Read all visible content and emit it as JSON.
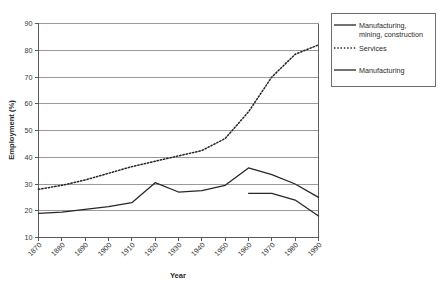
{
  "chart_data": {
    "type": "line",
    "title": "",
    "xlabel": "Year",
    "ylabel": "Employment (%)",
    "xlim": [
      1870,
      1990
    ],
    "ylim": [
      10,
      90
    ],
    "ytick_step": 10,
    "xtick_step": 10,
    "grid": true,
    "legend_position": "top-right",
    "categories": [
      1870,
      1880,
      1890,
      1900,
      1910,
      1920,
      1930,
      1940,
      1950,
      1960,
      1970,
      1980,
      1990
    ],
    "yticks": [
      10,
      20,
      30,
      40,
      50,
      60,
      70,
      80,
      90
    ],
    "xticks": [
      "1870",
      "1880",
      "1890",
      "1900",
      "1910",
      "1920",
      "1930",
      "1940",
      "1950",
      "1960",
      "1970",
      "1980",
      "1990"
    ],
    "series": [
      {
        "name": "Manufacturing, mining, construction",
        "style": "solid",
        "color": "#262626",
        "x": [
          1870,
          1880,
          1890,
          1900,
          1910,
          1920,
          1930,
          1940,
          1950,
          1960,
          1970,
          1980,
          1990
        ],
        "values": [
          19,
          19.5,
          20.5,
          21.5,
          23,
          30.5,
          27,
          27.5,
          29.5,
          36,
          33.5,
          30,
          25
        ]
      },
      {
        "name": "Services",
        "style": "dotted",
        "color": "#262626",
        "x": [
          1870,
          1880,
          1890,
          1900,
          1910,
          1920,
          1930,
          1940,
          1950,
          1960,
          1970,
          1980,
          1990
        ],
        "values": [
          28,
          29.5,
          31.5,
          34,
          36.5,
          38.5,
          40.5,
          42.5,
          47,
          57,
          70,
          78.5,
          82
        ]
      },
      {
        "name": "Manufacturing",
        "style": "solid",
        "color": "#262626",
        "x": [
          1960,
          1970,
          1980,
          1990
        ],
        "values": [
          26.5,
          26.5,
          24,
          18
        ]
      }
    ]
  },
  "legend": {
    "entries": [
      {
        "label_line1": "Manufacturing,",
        "label_line2": "mining, construction",
        "style": "solid"
      },
      {
        "label_line1": "Services",
        "label_line2": "",
        "style": "dotted"
      },
      {
        "label_line1": "Manufacturing",
        "label_line2": "",
        "style": "solid"
      }
    ]
  }
}
